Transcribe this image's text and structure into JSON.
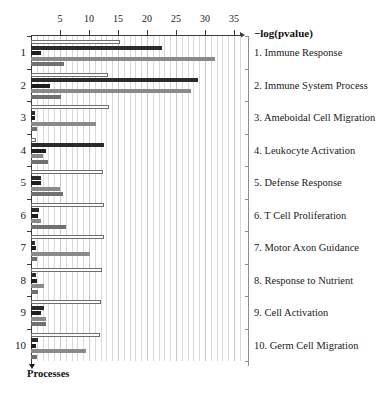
{
  "chart_data": {
    "type": "bar",
    "orientation": "horizontal",
    "title": "",
    "xlabel": "−log(pvalue)",
    "ylabel": "Processes",
    "xlim": [
      0,
      37
    ],
    "ylim": [
      0,
      10
    ],
    "grid": true,
    "legend_position": "none",
    "x_ticks": [
      5,
      10,
      15,
      20,
      25,
      30,
      35
    ],
    "x_tick_labels": [
      "5",
      "10",
      "15",
      "20",
      "25",
      "30",
      "35"
    ],
    "categories": [
      "1. Immune Response",
      "2. Immune System Process",
      "3. Ameboidal Cell Migration",
      "4. Leukocyte Activation",
      "5. Defense Response",
      "6. T Cell Proliferation",
      "7. Motor Axon Guidance",
      "8. Response to Nutrient",
      "9. Cell Activation",
      "10. Germ Cell Migration"
    ],
    "group_labels": [
      "1",
      "2",
      "3",
      "4",
      "5",
      "6",
      "7",
      "8",
      "9",
      "10"
    ],
    "series": [
      {
        "name": "series-1",
        "color": "#fdfdfd",
        "values": [
          15.0,
          13.0,
          13.1,
          0.5,
          12.1,
          12.3,
          12.2,
          11.9,
          11.8,
          11.6
        ]
      },
      {
        "name": "series-2",
        "color": "#2b2b2b",
        "values": [
          22.6,
          28.8,
          0.7,
          12.6,
          1.7,
          1.3,
          0.7,
          0.8,
          2.2,
          1.2
        ]
      },
      {
        "name": "series-3",
        "color": "#1e1e1e",
        "values": [
          1.7,
          3.3,
          0.7,
          2.6,
          1.7,
          1.2,
          0.9,
          1.0,
          1.8,
          0.9
        ]
      },
      {
        "name": "series-4",
        "color": "#8a8a8a",
        "values": [
          31.7,
          27.6,
          11.2,
          2.0,
          5.0,
          1.8,
          10.2,
          2.2,
          2.6,
          9.5
        ]
      },
      {
        "name": "series-5",
        "color": "#707070",
        "values": [
          5.7,
          5.2,
          1.0,
          3.0,
          5.5,
          6.0,
          1.1,
          1.2,
          2.6,
          1.0
        ]
      }
    ]
  }
}
